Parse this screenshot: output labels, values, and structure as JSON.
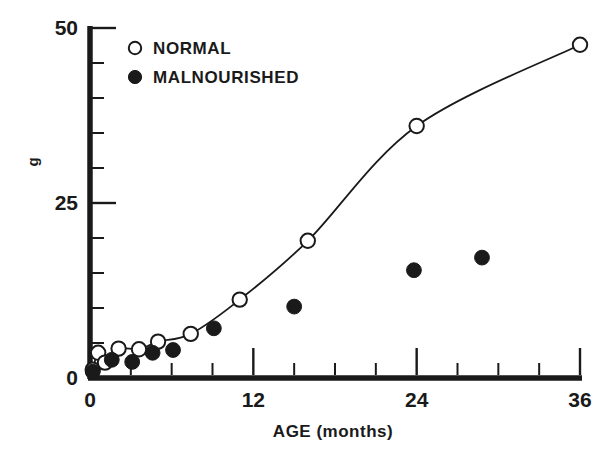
{
  "chart_data": {
    "type": "scatter",
    "title": "",
    "xlabel": "AGE (months)",
    "ylabel": "g",
    "xlim": [
      0,
      36
    ],
    "ylim": [
      0,
      50
    ],
    "grid": false,
    "legend_position": "top-left-inside",
    "x_tick_labels": [
      "0",
      "12",
      "24",
      "36"
    ],
    "x_tick_values": [
      0,
      12,
      24,
      36
    ],
    "x_minor_tick_values": [
      3,
      6,
      9,
      15,
      18,
      21,
      27,
      30,
      33
    ],
    "y_tick_labels": [
      "0",
      "25",
      "50"
    ],
    "y_tick_values": [
      0,
      25,
      50
    ],
    "y_minor_tick_values": [
      5,
      10,
      15,
      20,
      30,
      35,
      40,
      45
    ],
    "series": [
      {
        "name": "NORMAL",
        "marker": "open-circle",
        "has_line": true,
        "color": "#1a1a1a",
        "points": [
          {
            "x": 0.2,
            "y": 1.2
          },
          {
            "x": 0.6,
            "y": 3.6
          },
          {
            "x": 1.1,
            "y": 2.2
          },
          {
            "x": 2.1,
            "y": 4.2
          },
          {
            "x": 3.6,
            "y": 4.1
          },
          {
            "x": 5.0,
            "y": 5.2
          },
          {
            "x": 7.4,
            "y": 6.3
          },
          {
            "x": 11.0,
            "y": 11.2
          },
          {
            "x": 16.0,
            "y": 19.6
          },
          {
            "x": 24.0,
            "y": 36.0
          },
          {
            "x": 36.0,
            "y": 47.6
          }
        ]
      },
      {
        "name": "MALNOURISHED",
        "marker": "filled-circle",
        "has_line": false,
        "color": "#1a1a1a",
        "points": [
          {
            "x": 0.2,
            "y": 0.9
          },
          {
            "x": 1.6,
            "y": 2.6
          },
          {
            "x": 3.1,
            "y": 2.3
          },
          {
            "x": 4.6,
            "y": 3.6
          },
          {
            "x": 6.1,
            "y": 4.0
          },
          {
            "x": 9.1,
            "y": 7.1
          },
          {
            "x": 15.0,
            "y": 10.2
          },
          {
            "x": 23.8,
            "y": 15.4
          },
          {
            "x": 28.8,
            "y": 17.2
          }
        ]
      }
    ]
  },
  "legend": {
    "items": [
      {
        "label": "NORMAL",
        "marker": "open-circle"
      },
      {
        "label": "MALNOURISHED",
        "marker": "filled-circle"
      }
    ]
  },
  "colors": {
    "ink": "#1a1a1a",
    "background": "#ffffff"
  }
}
